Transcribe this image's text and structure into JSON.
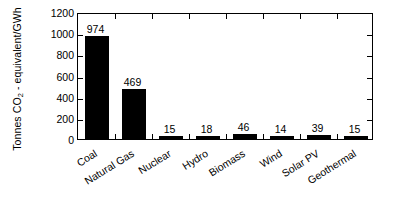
{
  "chart_data": {
    "type": "bar",
    "title": "",
    "xlabel": "",
    "ylabel": "Tonnes CO2 - equivalent/GWh",
    "ylabel_parts": {
      "pre": "Tonnes CO",
      "sub": "2",
      "post": " - equivalent/GWh"
    },
    "categories": [
      "Coal",
      "Natural Gas",
      "Nuclear",
      "Hydro",
      "Biomass",
      "Wind",
      "Solar PV",
      "Geothermal"
    ],
    "values": [
      974,
      469,
      15,
      18,
      46,
      14,
      39,
      15
    ],
    "value_labels": [
      "974",
      "469",
      "15",
      "18",
      "46",
      "14",
      "39",
      "15"
    ],
    "ylim": [
      0,
      1200
    ],
    "yticks": [
      0,
      200,
      400,
      600,
      800,
      1000,
      1200
    ],
    "ytick_labels": [
      "0",
      "200",
      "400",
      "600",
      "800",
      "1000",
      "1200"
    ],
    "grid": false,
    "legend": null,
    "bar_color": "#000000",
    "axis_color": "#000000",
    "background_color": "#ffffff"
  }
}
